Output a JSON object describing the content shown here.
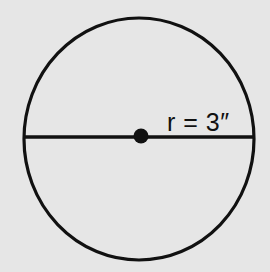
{
  "diagram": {
    "shape": "circle",
    "radius_label": "r = 3″",
    "elements": [
      "circle-outline",
      "diameter-line",
      "center-point",
      "radius-label"
    ],
    "colors": {
      "background": "#e6e6e6",
      "stroke": "#111111"
    }
  }
}
